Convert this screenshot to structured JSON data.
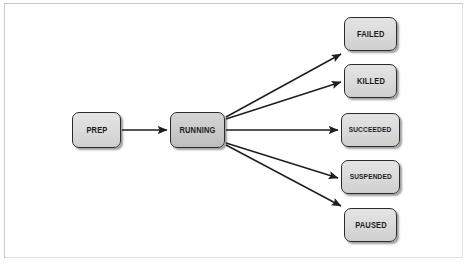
{
  "figure": {
    "kind": "state-transition-diagram",
    "background_color": "#ffffff",
    "frame_color": "#c9c9c9",
    "edge_color": "#1f1f1f",
    "node_border_color": "#2b2b2b",
    "node_fill_color": "#dcdcdc",
    "node_active_fill_color": "#cccccc",
    "label_color": "#1a1a1a"
  },
  "nodes": [
    {
      "id": "prep",
      "label": "PREP",
      "x": 72,
      "y": 112,
      "w": 49,
      "h": 36,
      "state": "normal"
    },
    {
      "id": "running",
      "label": "RUNNING",
      "x": 170,
      "y": 112,
      "w": 55,
      "h": 36,
      "state": "active"
    },
    {
      "id": "failed",
      "label": "FAILED",
      "x": 344,
      "y": 17,
      "w": 53,
      "h": 34,
      "state": "normal"
    },
    {
      "id": "killed",
      "label": "KILLED",
      "x": 344,
      "y": 64,
      "w": 53,
      "h": 34,
      "state": "normal"
    },
    {
      "id": "succeeded",
      "label": "SUCCEEDED",
      "x": 341,
      "y": 113,
      "w": 59,
      "h": 34,
      "state": "normal"
    },
    {
      "id": "suspended",
      "label": "SUSPENDED",
      "x": 341,
      "y": 160,
      "w": 59,
      "h": 34,
      "state": "normal"
    },
    {
      "id": "paused",
      "label": "PAUSED",
      "x": 344,
      "y": 208,
      "w": 53,
      "h": 34,
      "state": "normal"
    }
  ],
  "edges": [
    {
      "id": "prep-running",
      "from": "prep",
      "to": "running",
      "label": "",
      "x1": 122,
      "y1": 130,
      "x2": 167,
      "y2": 130
    },
    {
      "id": "running-failed",
      "from": "running",
      "to": "failed",
      "label": "",
      "x1": 226,
      "y1": 117,
      "x2": 341,
      "y2": 54
    },
    {
      "id": "running-killed",
      "from": "running",
      "to": "killed",
      "label": "",
      "x1": 226,
      "y1": 119,
      "x2": 341,
      "y2": 82
    },
    {
      "id": "running-succeeded",
      "from": "running",
      "to": "succeeded",
      "label": "",
      "x1": 226,
      "y1": 130,
      "x2": 338,
      "y2": 130
    },
    {
      "id": "running-suspended",
      "from": "running",
      "to": "suspended",
      "label": "",
      "x1": 226,
      "y1": 143,
      "x2": 338,
      "y2": 178
    },
    {
      "id": "running-paused",
      "from": "running",
      "to": "paused",
      "label": "",
      "x1": 226,
      "y1": 145,
      "x2": 341,
      "y2": 206
    }
  ]
}
